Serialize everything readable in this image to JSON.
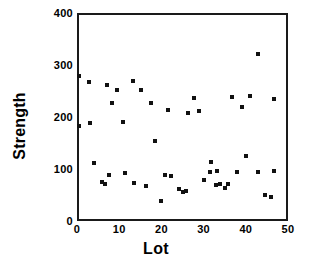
{
  "chart_data": {
    "type": "scatter",
    "title": "",
    "xlabel": "Lot",
    "ylabel": "Strength",
    "xlim": [
      0,
      50
    ],
    "ylim": [
      0,
      400
    ],
    "xticks": [
      0,
      10,
      20,
      30,
      40,
      50
    ],
    "yticks": [
      0,
      100,
      200,
      300,
      400
    ],
    "xtick_labels": [
      "0",
      "10",
      "20",
      "30",
      "40",
      "50"
    ],
    "ytick_labels": [
      "0",
      "100",
      "200",
      "300",
      "400"
    ],
    "grid": false,
    "legend": null,
    "marker": "square",
    "marker_color": "#111111",
    "series": [
      {
        "name": "Strength",
        "points": [
          [
            0.5,
            279
          ],
          [
            0.5,
            182
          ],
          [
            2.8,
            267
          ],
          [
            3.0,
            188
          ],
          [
            4.0,
            112
          ],
          [
            6.0,
            75
          ],
          [
            6.6,
            72
          ],
          [
            7.2,
            262
          ],
          [
            7.6,
            88
          ],
          [
            8.4,
            226
          ],
          [
            9.4,
            251
          ],
          [
            11.0,
            191
          ],
          [
            11.4,
            92
          ],
          [
            13.2,
            270
          ],
          [
            13.6,
            73
          ],
          [
            15.2,
            251
          ],
          [
            16.4,
            68
          ],
          [
            17.6,
            227
          ],
          [
            18.6,
            154
          ],
          [
            20.0,
            38
          ],
          [
            20.8,
            89
          ],
          [
            21.6,
            213
          ],
          [
            22.2,
            87
          ],
          [
            24.2,
            61
          ],
          [
            25.0,
            56
          ],
          [
            25.8,
            58
          ],
          [
            26.4,
            208
          ],
          [
            27.8,
            236
          ],
          [
            28.8,
            211
          ],
          [
            30.2,
            79
          ],
          [
            31.4,
            94
          ],
          [
            31.8,
            114
          ],
          [
            33.0,
            69
          ],
          [
            33.2,
            97
          ],
          [
            34.0,
            72
          ],
          [
            35.0,
            64
          ],
          [
            35.8,
            72
          ],
          [
            36.8,
            239
          ],
          [
            37.8,
            95
          ],
          [
            39.2,
            220
          ],
          [
            40.0,
            125
          ],
          [
            41.0,
            241
          ],
          [
            42.8,
            321
          ],
          [
            43.0,
            94
          ],
          [
            44.6,
            50
          ],
          [
            46.0,
            46
          ],
          [
            46.6,
            235
          ],
          [
            46.6,
            97
          ]
        ]
      }
    ]
  }
}
